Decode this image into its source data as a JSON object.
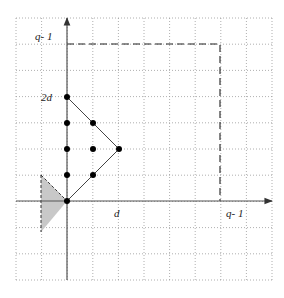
{
  "figure": {
    "width": 284,
    "height": 298,
    "grid": {
      "x0": 16,
      "y0": 18,
      "cols": 10,
      "rows": 10,
      "step_x": 25.6,
      "step_y": 26.2,
      "color": "#9a9a9a"
    },
    "origin": {
      "x": 67,
      "y": 201
    },
    "axes": {
      "color": "#555555",
      "x_end": 272,
      "y_top": 18,
      "y_bottom": 280
    },
    "labels": {
      "y_top": "q- 1",
      "y_mid": "2d",
      "x_mid": "d",
      "x_right": "q- 1"
    },
    "dashed_box": {
      "top_y": 44,
      "right_x": 220,
      "color": "#222222"
    },
    "triangle_path": [
      [
        67,
        97
      ],
      [
        119,
        149
      ],
      [
        67,
        201
      ]
    ],
    "points": [
      [
        67,
        97
      ],
      [
        67,
        123
      ],
      [
        93,
        123
      ],
      [
        67,
        149
      ],
      [
        93,
        149
      ],
      [
        119,
        149
      ],
      [
        67,
        175
      ],
      [
        93,
        175
      ],
      [
        67,
        201
      ]
    ],
    "shaded_region": {
      "vertices": [
        [
          41,
          175
        ],
        [
          67,
          201
        ],
        [
          41,
          232
        ]
      ],
      "fill": "#c8c8c8"
    }
  }
}
